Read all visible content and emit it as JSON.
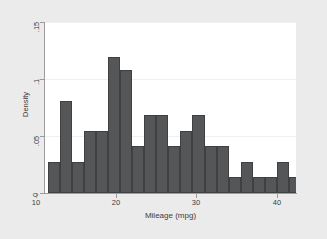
{
  "chart_data": {
    "type": "bar",
    "title": "",
    "subtitle": "",
    "xlabel": "Mileage (mpg)",
    "ylabel": "Density",
    "xlim": [
      11.0,
      42.4
    ],
    "ylim": [
      0,
      0.15
    ],
    "xticks": [
      10,
      20,
      30,
      40
    ],
    "xtick_labels": [
      "10",
      "20",
      "30",
      "40"
    ],
    "yticks": [
      0,
      0.05,
      0.1,
      0.15
    ],
    "ytick_labels": [
      "0",
      ".05",
      ".1",
      ".15"
    ],
    "grid": "horizontal",
    "legend": "none",
    "bin_width": 1.5,
    "bar_color": "#555658",
    "bar_edge_color": "#3f4042",
    "plot_background": "#ffffff",
    "figure_background": "#ebebeb",
    "axis_color": "#9c9c9c",
    "gridline_color": "#f0f0f0",
    "bins": [
      {
        "x0": 11.5,
        "x1": 13.0,
        "density": 0.027
      },
      {
        "x0": 13.0,
        "x1": 14.5,
        "density": 0.081
      },
      {
        "x0": 14.5,
        "x1": 16.0,
        "density": 0.027
      },
      {
        "x0": 16.0,
        "x1": 17.5,
        "density": 0.054
      },
      {
        "x0": 17.5,
        "x1": 19.0,
        "density": 0.054
      },
      {
        "x0": 19.0,
        "x1": 20.5,
        "density": 0.119
      },
      {
        "x0": 20.5,
        "x1": 22.0,
        "density": 0.108
      },
      {
        "x0": 22.0,
        "x1": 23.5,
        "density": 0.041
      },
      {
        "x0": 23.5,
        "x1": 25.0,
        "density": 0.068
      },
      {
        "x0": 25.0,
        "x1": 26.5,
        "density": 0.068
      },
      {
        "x0": 26.5,
        "x1": 28.0,
        "density": 0.041
      },
      {
        "x0": 28.0,
        "x1": 29.5,
        "density": 0.054
      },
      {
        "x0": 29.5,
        "x1": 31.0,
        "density": 0.068
      },
      {
        "x0": 31.0,
        "x1": 32.5,
        "density": 0.041
      },
      {
        "x0": 32.5,
        "x1": 34.0,
        "density": 0.041
      },
      {
        "x0": 34.0,
        "x1": 35.5,
        "density": 0.014
      },
      {
        "x0": 35.5,
        "x1": 37.0,
        "density": 0.027
      },
      {
        "x0": 37.0,
        "x1": 38.5,
        "density": 0.014
      },
      {
        "x0": 38.5,
        "x1": 40.0,
        "density": 0.014
      },
      {
        "x0": 40.0,
        "x1": 41.5,
        "density": 0.027
      },
      {
        "x0": 41.5,
        "x1": 43.0,
        "density": 0.014
      },
      {
        "x0": 43.0,
        "x1": 44.5,
        "density": 0.0
      },
      {
        "x0": 44.5,
        "x1": 46.0,
        "density": 0.014
      }
    ],
    "bars_px": [
      {
        "left": 54,
        "width": 12,
        "density": 0.027
      },
      {
        "left": 70,
        "width": 12,
        "density": 0.081
      },
      {
        "left": 82,
        "width": 12,
        "density": 0.027
      },
      {
        "left": 94,
        "width": 12,
        "density": 0.054
      },
      {
        "left": 106,
        "width": 12,
        "density": 0.054
      },
      {
        "left": 118,
        "width": 12,
        "density": 0.119
      },
      {
        "left": 130,
        "width": 12,
        "density": 0.108
      },
      {
        "left": 142,
        "width": 12,
        "density": 0.041
      },
      {
        "left": 154,
        "width": 12,
        "density": 0.068
      },
      {
        "left": 166,
        "width": 12,
        "density": 0.068
      },
      {
        "left": 178,
        "width": 12,
        "density": 0.041
      },
      {
        "left": 190,
        "width": 12,
        "density": 0.054
      },
      {
        "left": 202,
        "width": 12,
        "density": 0.068
      },
      {
        "left": 214,
        "width": 12,
        "density": 0.041
      },
      {
        "left": 238,
        "width": 12,
        "density": 0.041
      },
      {
        "left": 250,
        "width": 12,
        "density": 0.014
      },
      {
        "left": 262,
        "width": 12,
        "density": 0.027
      },
      {
        "left": 274,
        "width": 12,
        "density": 0.014
      },
      {
        "left": 310,
        "width": 12,
        "density": 0.014
      },
      {
        "left": 322,
        "width": 12,
        "density": 0.027
      },
      {
        "left": 406,
        "width": 12,
        "density": 0.014
      }
    ]
  }
}
